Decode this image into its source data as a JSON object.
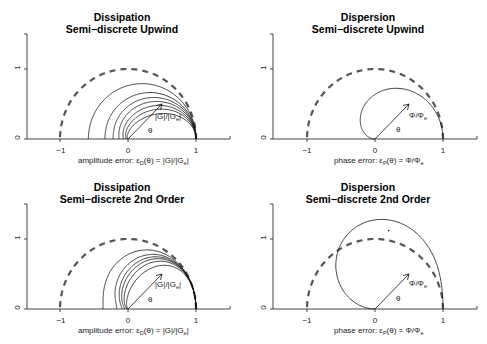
{
  "chart_data": [
    {
      "type": "line",
      "subtype": "polar",
      "title": "Dissipation",
      "subtitle": "Semi−discrete Upwind",
      "xlabel": "amplitude error: εD(θ) = |G|/|Ge|",
      "annotation_vector": "|G|/|Ge|",
      "annotation_angle": "θ",
      "xlim": [
        -1.5,
        1.5
      ],
      "ylim": [
        0,
        1.5
      ],
      "xticks": [
        "-1",
        "0",
        "1"
      ],
      "yticks": [
        "0",
        "1"
      ],
      "formula": "r(θ) = exp(-a(1 - cos θ))",
      "series_params": [
        0.27,
        0.54,
        0.76,
        1.0,
        1.33,
        1.75,
        2.5
      ],
      "left_intercepts": [
        -0.58,
        -0.34,
        -0.22,
        -0.13,
        -0.07,
        -0.03,
        0.0
      ],
      "reference": "unit semicircle (dashed)"
    },
    {
      "type": "line",
      "subtype": "polar",
      "title": "Dispersion",
      "subtitle": "Semi−discrete Upwind",
      "xlabel": "phase error: εP(θ) = Φ/Φe",
      "annotation_vector": "Φ/Φe",
      "annotation_angle": "θ",
      "xlim": [
        -1.5,
        1.5
      ],
      "ylim": [
        0,
        1.5
      ],
      "xticks": [
        "-1",
        "0",
        "1"
      ],
      "yticks": [
        "0",
        "1"
      ],
      "formula": "r(θ) = sin θ / θ",
      "peak": [
        0.3,
        0.72
      ],
      "left_extent": -0.24,
      "reference": "unit semicircle (dashed)"
    },
    {
      "type": "line",
      "subtype": "polar",
      "title": "Dissipation",
      "subtitle": "Semi−discrete 2nd Order",
      "xlabel": "amplitude error: εD(θ) = |G|/|Ge|",
      "annotation_vector": "|G|/|Ge|",
      "annotation_angle": "θ",
      "xlim": [
        -1.5,
        1.5
      ],
      "ylim": [
        0,
        1.5
      ],
      "xticks": [
        "-1",
        "0",
        "1"
      ],
      "yticks": [
        "0",
        "1"
      ],
      "formula": "r(θ) = exp(-a(1 - cos θ)^2)",
      "series_params": [
        0.25,
        0.45,
        0.6,
        0.75,
        1.0,
        1.6
      ],
      "left_intercepts": [
        -0.37,
        -0.16,
        -0.1,
        -0.06,
        -0.03,
        0.0
      ],
      "reference": "unit semicircle (dashed)"
    },
    {
      "type": "line",
      "subtype": "polar",
      "title": "Dispersion",
      "subtitle": "Semi−discrete 2nd Order",
      "xlabel": "phase error: εP(θ) = Φ/Φe",
      "annotation_vector": "Φ/Φe",
      "annotation_angle": "θ",
      "xlim": [
        -1.5,
        1.5
      ],
      "ylim": [
        0,
        1.5
      ],
      "xticks": [
        "-1",
        "0",
        "1"
      ],
      "yticks": [
        "0",
        "1"
      ],
      "formula": "r(θ) = sin θ (2 - cos θ) / θ",
      "peak": [
        0.1,
        1.28
      ],
      "left_extent": -0.56,
      "stray_point": [
        0.2,
        1.12
      ],
      "reference": "unit semicircle (dashed)"
    }
  ],
  "panels": [
    {
      "title": "Dissipation",
      "subtitle": "Semi−discrete Upwind",
      "xlabel_pre": "amplitude error: ε",
      "xlabel_sub": "D",
      "xlabel_post": "(θ) = |G|/|G",
      "xlabel_sub2": "e",
      "xlabel_end": "|",
      "vec_pre": "|G|/|G",
      "vec_sub": "e",
      "vec_end": "|",
      "theta": "θ",
      "ticks_x": [
        "−1",
        "0",
        "1"
      ],
      "ticks_y": [
        "0",
        "1"
      ]
    },
    {
      "title": "Dispersion",
      "subtitle": "Semi−discrete Upwind",
      "xlabel_pre": "phase error: ε",
      "xlabel_sub": "P",
      "xlabel_post": "(θ) = Φ/Φ",
      "xlabel_sub2": "e",
      "xlabel_end": "",
      "vec_pre": "Φ/Φ",
      "vec_sub": "e",
      "vec_end": "",
      "theta": "θ",
      "ticks_x": [
        "−1",
        "0",
        "1"
      ],
      "ticks_y": [
        "0",
        "1"
      ]
    },
    {
      "title": "Dissipation",
      "subtitle": "Semi−discrete 2nd Order",
      "xlabel_pre": "amplitude error: ε",
      "xlabel_sub": "D",
      "xlabel_post": "(θ) = |G|/|G",
      "xlabel_sub2": "e",
      "xlabel_end": "|",
      "vec_pre": "|G|/|G",
      "vec_sub": "e",
      "vec_end": "|",
      "theta": "θ",
      "ticks_x": [
        "−1",
        "0",
        "1"
      ],
      "ticks_y": [
        "0",
        "1"
      ]
    },
    {
      "title": "Dispersion",
      "subtitle": "Semi−discrete 2nd Order",
      "xlabel_pre": "phase error: ε",
      "xlabel_sub": "P",
      "xlabel_post": "(θ) = Φ/Φ",
      "xlabel_sub2": "e",
      "xlabel_end": "",
      "vec_pre": "Φ/Φ",
      "vec_sub": "e",
      "vec_end": "",
      "theta": "θ",
      "ticks_x": [
        "−1",
        "0",
        "1"
      ],
      "ticks_y": [
        "0",
        "1"
      ]
    }
  ],
  "colors": {
    "curve": "#111111",
    "reference_dashed": "#555555",
    "axis": "#444444"
  }
}
